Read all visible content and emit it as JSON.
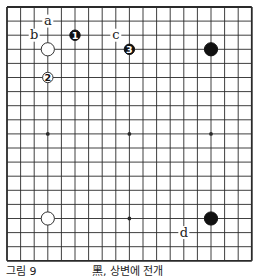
{
  "diagram": {
    "type": "go-board",
    "size": 19,
    "grid": {
      "x0": 7,
      "y0": 7,
      "dx": 13.6,
      "dy": 14.1
    },
    "colors": {
      "line": "#2a2a2a",
      "black": "#111111",
      "white": "#ffffff",
      "background": "#ffffff"
    },
    "hoshi": [
      [
        3,
        3
      ],
      [
        9,
        3
      ],
      [
        15,
        3
      ],
      [
        3,
        9
      ],
      [
        9,
        9
      ],
      [
        15,
        9
      ],
      [
        3,
        15
      ],
      [
        9,
        15
      ],
      [
        15,
        15
      ]
    ],
    "stones": [
      {
        "color": "white",
        "col": 3,
        "row": 3,
        "label": "",
        "size": "large"
      },
      {
        "color": "black",
        "col": 15,
        "row": 3,
        "label": "",
        "size": "large"
      },
      {
        "color": "white",
        "col": 3,
        "row": 15,
        "label": "",
        "size": "large"
      },
      {
        "color": "black",
        "col": 15,
        "row": 15,
        "label": "",
        "size": "large"
      },
      {
        "color": "black",
        "col": 5,
        "row": 2,
        "label": "1",
        "size": "small"
      },
      {
        "color": "white",
        "col": 3,
        "row": 5,
        "label": "2",
        "size": "small"
      },
      {
        "color": "black",
        "col": 9,
        "row": 3,
        "label": "3",
        "size": "small"
      }
    ],
    "letters": [
      {
        "text": "a",
        "col": 3,
        "row": 1
      },
      {
        "text": "b",
        "col": 2,
        "row": 2
      },
      {
        "text": "c",
        "col": 8,
        "row": 2
      },
      {
        "text": "d",
        "col": 13,
        "row": 16
      }
    ]
  },
  "caption": {
    "figure_number": "그림 9",
    "title": "黑, 상변에 전개"
  }
}
